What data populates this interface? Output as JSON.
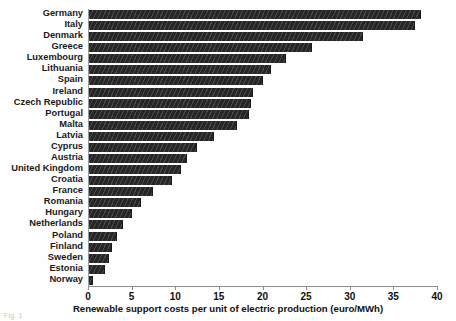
{
  "chart_data": {
    "type": "bar",
    "orientation": "horizontal",
    "title": "",
    "xlabel": "Renewable support costs per unit of  electric production (euro/MWh)",
    "ylabel": "",
    "xlim": [
      0,
      40
    ],
    "xticks": [
      0,
      5,
      10,
      15,
      20,
      25,
      30,
      35,
      40
    ],
    "grid": false,
    "legend": null,
    "bar_color": "#262626",
    "bar_hatch": "diagonal-stripes",
    "categories": [
      "Germany",
      "Italy",
      "Denmark",
      "Greece",
      "Luxembourg",
      "Lithuania",
      "Spain",
      "Ireland",
      "Czech Republic",
      "Portugal",
      "Malta",
      "Latvia",
      "Cyprus",
      "Austria",
      "United Kingdom",
      "Croatia",
      "France",
      "Romania",
      "Hungary",
      "Netherlands",
      "Poland",
      "Finland",
      "Sweden",
      "Estonia",
      "Norway"
    ],
    "values": [
      38.0,
      37.4,
      31.4,
      25.6,
      22.6,
      20.9,
      19.9,
      18.8,
      18.6,
      18.3,
      17.0,
      14.3,
      12.4,
      11.2,
      10.5,
      9.5,
      7.3,
      6.0,
      4.9,
      3.9,
      3.2,
      2.6,
      2.3,
      1.8,
      0.5
    ]
  },
  "caption": "Fig. 1"
}
